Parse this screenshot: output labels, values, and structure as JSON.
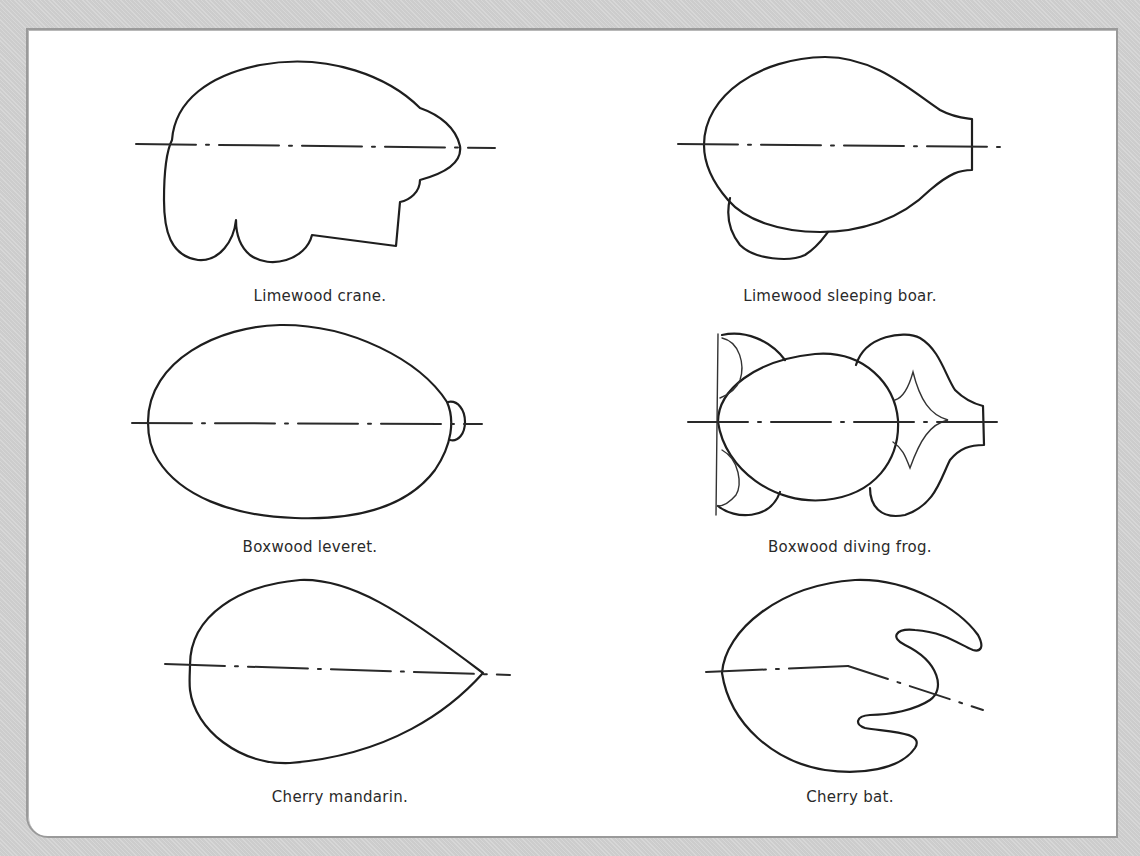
{
  "figures": [
    {
      "id": "limewood-crane",
      "caption": "Limewood crane.",
      "icon": "crane-outline-icon"
    },
    {
      "id": "limewood-sleeping-boar",
      "caption": "Limewood sleeping boar.",
      "icon": "boar-outline-icon"
    },
    {
      "id": "boxwood-leveret",
      "caption": "Boxwood leveret.",
      "icon": "leveret-outline-icon"
    },
    {
      "id": "boxwood-diving-frog",
      "caption": "Boxwood diving frog.",
      "icon": "frog-outline-icon"
    },
    {
      "id": "cherry-mandarin",
      "caption": "Cherry mandarin.",
      "icon": "mandarin-outline-icon"
    },
    {
      "id": "cherry-bat",
      "caption": "Cherry bat.",
      "icon": "bat-outline-icon"
    }
  ],
  "colors": {
    "background": "#d3d3d3",
    "panel": "#ffffff",
    "panel_border": "#9a9a9a",
    "stroke": "#1e1e1e",
    "caption_text": "#2a2a2a"
  }
}
